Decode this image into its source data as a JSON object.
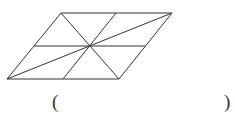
{
  "figure": {
    "type": "parallelogram-divided",
    "stroke": "#333333",
    "vertices": {
      "top_left": [
        61,
        13
      ],
      "top_right": [
        172,
        13
      ],
      "bottom_right": [
        119,
        79
      ],
      "bottom_left": [
        7,
        79
      ]
    },
    "center": [
      89,
      46
    ],
    "segments": [
      [
        [
          61,
          13
        ],
        [
          172,
          13
        ]
      ],
      [
        [
          172,
          13
        ],
        [
          119,
          79
        ]
      ],
      [
        [
          119,
          79
        ],
        [
          7,
          79
        ]
      ],
      [
        [
          7,
          79
        ],
        [
          61,
          13
        ]
      ],
      [
        [
          34,
          46
        ],
        [
          145,
          46
        ]
      ],
      [
        [
          116,
          13
        ],
        [
          63,
          79
        ]
      ],
      [
        [
          61,
          13
        ],
        [
          119,
          79
        ]
      ],
      [
        [
          7,
          79
        ],
        [
          172,
          13
        ]
      ]
    ]
  },
  "answer": {
    "open_paren": "(",
    "close_paren": ")",
    "value": ""
  }
}
